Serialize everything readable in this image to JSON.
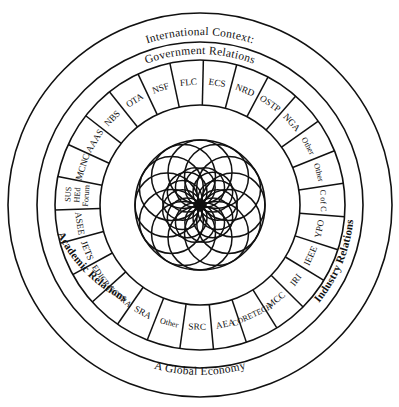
{
  "figure": {
    "center_x": 200,
    "center_y": 205,
    "colors": {
      "stroke": "#111111",
      "background": "#ffffff"
    }
  },
  "rings": {
    "outer_ring": {
      "name": "international-context-ring",
      "label": "International Context:",
      "outer_radius": 192,
      "inner_radius": 163
    },
    "quadrant_ring": {
      "name": "relations-ring",
      "outer_radius": 163,
      "inner_radius": 145,
      "labels": {
        "top": "Government Relations",
        "left": "Academic Relations",
        "right": "Industry Relations",
        "bottom": "A Global Economy"
      }
    },
    "segment_ring": {
      "name": "organizations-ring",
      "outer_radius": 145,
      "inner_radius": 100,
      "segment_count": 27
    },
    "core": {
      "name": "rosette-core",
      "radius": 65,
      "petal_count": 12,
      "petal_radius": 32
    }
  },
  "segments": [
    {
      "id": "ecs",
      "label": "ECS",
      "size": "normal",
      "lines": [
        "ECS"
      ]
    },
    {
      "id": "nrd",
      "label": "NRD",
      "size": "normal",
      "lines": [
        "NRD"
      ]
    },
    {
      "id": "ostp",
      "label": "OSTP",
      "size": "normal",
      "lines": [
        "OSTP"
      ]
    },
    {
      "id": "nga",
      "label": "NGA",
      "size": "normal",
      "lines": [
        "NGA"
      ]
    },
    {
      "id": "other-1",
      "label": "Other",
      "size": "small",
      "lines": [
        "Other"
      ]
    },
    {
      "id": "other-2",
      "label": "Other",
      "size": "small",
      "lines": [
        "Other"
      ]
    },
    {
      "id": "c-of-c",
      "label": "C of C",
      "size": "small",
      "lines": [
        "C of C"
      ]
    },
    {
      "id": "ypo",
      "label": "YPO",
      "size": "normal",
      "lines": [
        "YPO"
      ]
    },
    {
      "id": "ieee",
      "label": "IEEE",
      "size": "normal",
      "lines": [
        "IEEE"
      ]
    },
    {
      "id": "iri",
      "label": "IRI",
      "size": "normal",
      "lines": [
        "IRI"
      ]
    },
    {
      "id": "mcc",
      "label": "MCC",
      "size": "normal",
      "lines": [
        "MCC"
      ]
    },
    {
      "id": "coretech",
      "label": "CORETECH",
      "size": "small",
      "lines": [
        "CORETECH"
      ]
    },
    {
      "id": "aea",
      "label": "AEA",
      "size": "normal",
      "lines": [
        "AEA"
      ]
    },
    {
      "id": "src",
      "label": "SRC",
      "size": "normal",
      "lines": [
        "SRC"
      ]
    },
    {
      "id": "other-3",
      "label": "Other",
      "size": "small",
      "lines": [
        "Other"
      ]
    },
    {
      "id": "sra",
      "label": "SRA",
      "size": "normal",
      "lines": [
        "SRA"
      ]
    },
    {
      "id": "ncura",
      "label": "NCURA",
      "size": "small",
      "lines": [
        "NCURA"
      ]
    },
    {
      "id": "edicp",
      "label": "EDICP",
      "size": "small",
      "lines": [
        "EDICP"
      ]
    },
    {
      "id": "jets",
      "label": "JETS",
      "size": "normal",
      "lines": [
        "JETS"
      ]
    },
    {
      "id": "asee",
      "label": "ASEE",
      "size": "normal",
      "lines": [
        "ASEE"
      ]
    },
    {
      "id": "sus-hed-forum",
      "label": "SUS HEd Forum",
      "size": "small",
      "lines": [
        "SUS",
        "HEd",
        "Forum"
      ]
    },
    {
      "id": "mcnc",
      "label": "MCNC",
      "size": "normal",
      "lines": [
        "MCNC"
      ]
    },
    {
      "id": "aaas",
      "label": "AAAS",
      "size": "normal",
      "lines": [
        "AAAS"
      ]
    },
    {
      "id": "nbs",
      "label": "NBS",
      "size": "normal",
      "lines": [
        "NBS"
      ]
    },
    {
      "id": "ota",
      "label": "OTA",
      "size": "normal",
      "lines": [
        "OTA"
      ]
    },
    {
      "id": "nsf",
      "label": "NSF",
      "size": "normal",
      "lines": [
        "NSF"
      ]
    },
    {
      "id": "flc",
      "label": "FLC",
      "size": "normal",
      "lines": [
        "FLC"
      ]
    }
  ]
}
